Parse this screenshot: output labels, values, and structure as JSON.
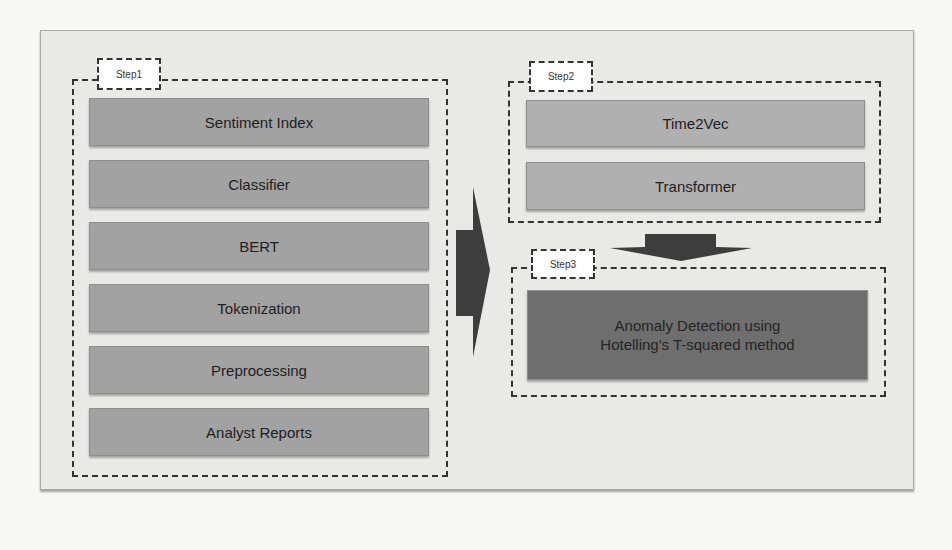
{
  "diagram": {
    "steps": [
      {
        "label": "Step1",
        "items": [
          "Sentiment Index",
          "Classifier",
          "BERT",
          "Tokenization",
          "Preprocessing",
          "Analyst Reports"
        ]
      },
      {
        "label": "Step2",
        "items": [
          "Time2Vec",
          "Transformer"
        ]
      },
      {
        "label": "Step3",
        "items": [
          "Anomaly Detection using Hotelling's T-squared method"
        ],
        "lines": [
          "Anomaly Detection using",
          "Hotelling's T-squared method"
        ]
      }
    ],
    "arrows": [
      {
        "from": "Step1",
        "to": "Step2/Step3",
        "direction": "right",
        "icon": "right-arrow-icon"
      },
      {
        "from": "Step2",
        "to": "Step3",
        "direction": "down",
        "icon": "down-arrow-icon"
      }
    ],
    "colors": {
      "panel_bg": "#e9e9e8",
      "step1_box": "#a2a2a2",
      "step2_box": "#b0b0b0",
      "step3_box": "#6e6e6e",
      "arrow": "#3d3d3d"
    }
  }
}
